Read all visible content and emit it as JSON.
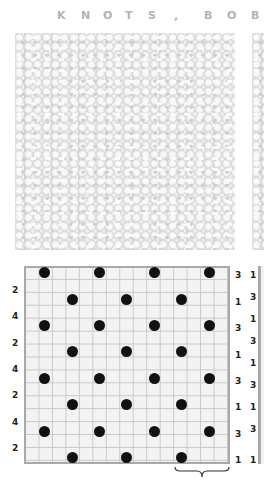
{
  "header": {
    "title_letters": [
      {
        "ch": "K",
        "x": 57
      },
      {
        "ch": "N",
        "x": 81
      },
      {
        "ch": "O",
        "x": 103
      },
      {
        "ch": "T",
        "x": 125
      },
      {
        "ch": "S",
        "x": 148
      },
      {
        "ch": ",",
        "x": 174
      },
      {
        "ch": "B",
        "x": 204
      },
      {
        "ch": "O",
        "x": 227
      },
      {
        "ch": "B",
        "x": 251
      }
    ],
    "title_text": "KNOTS, BOB"
  },
  "photo": {
    "label": "knitted swatch photo"
  },
  "chart": {
    "cols": 15,
    "rows": 15,
    "grid_left": 24,
    "grid_top": 266,
    "cell_w": 13.73,
    "cell_h": 13.2,
    "dot_rows": [
      {
        "row": 1,
        "cols": [
          2,
          6,
          10,
          14
        ]
      },
      {
        "row": 3,
        "cols": [
          4,
          8,
          12
        ]
      },
      {
        "row": 5,
        "cols": [
          2,
          6,
          10,
          14
        ]
      },
      {
        "row": 7,
        "cols": [
          4,
          8,
          12
        ]
      },
      {
        "row": 9,
        "cols": [
          2,
          6,
          10,
          14
        ]
      },
      {
        "row": 11,
        "cols": [
          4,
          8,
          12
        ]
      },
      {
        "row": 13,
        "cols": [
          2,
          6,
          10,
          14
        ]
      },
      {
        "row": 15,
        "cols": [
          4,
          8,
          12
        ]
      }
    ],
    "left_labels": [
      {
        "text": "2",
        "y": 285
      },
      {
        "text": "4",
        "y": 311
      },
      {
        "text": "2",
        "y": 338
      },
      {
        "text": "4",
        "y": 364
      },
      {
        "text": "2",
        "y": 390
      },
      {
        "text": "4",
        "y": 417
      },
      {
        "text": "2",
        "y": 443
      }
    ],
    "right_labels": [
      {
        "text": "3",
        "y": 270
      },
      {
        "text": "1",
        "y": 297
      },
      {
        "text": "3",
        "y": 323
      },
      {
        "text": "1",
        "y": 350
      },
      {
        "text": "3",
        "y": 376
      },
      {
        "text": "1",
        "y": 402
      },
      {
        "text": "3",
        "y": 429
      },
      {
        "text": "1",
        "y": 455
      }
    ],
    "repeat_brace": {
      "from_col": 12,
      "to_col": 15
    }
  },
  "side_chart": {
    "labels": [
      {
        "text": "1",
        "y": 270
      },
      {
        "text": "3",
        "y": 292
      },
      {
        "text": "1",
        "y": 314
      },
      {
        "text": "3",
        "y": 336
      },
      {
        "text": "1",
        "y": 358
      },
      {
        "text": "3",
        "y": 380
      },
      {
        "text": "1",
        "y": 402
      },
      {
        "text": "3",
        "y": 424
      },
      {
        "text": "1",
        "y": 455
      }
    ]
  }
}
